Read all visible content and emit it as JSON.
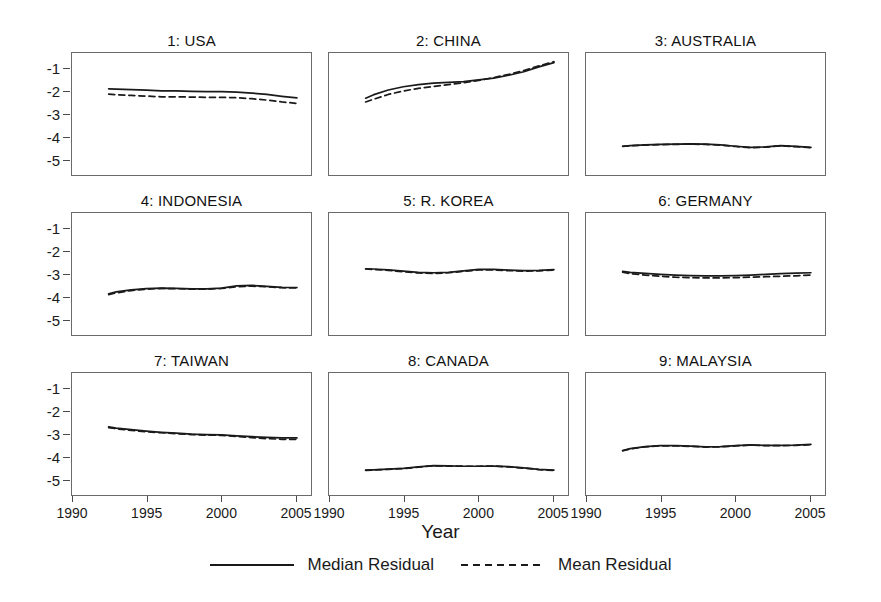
{
  "figure": {
    "xaxis_title": "Year",
    "yaxis_ticks": [
      "-1",
      "-2",
      "-3",
      "-4",
      "-5"
    ],
    "xaxis_ticks": [
      "1990",
      "1995",
      "2000",
      "2005"
    ]
  },
  "legend": {
    "position": "bottom-center",
    "entries": [
      {
        "label": "Median Residual",
        "style": "solid",
        "icon": "solid-line-icon"
      },
      {
        "label": "Mean Residual",
        "style": "dashed",
        "icon": "dashed-line-icon"
      }
    ]
  },
  "colors": {
    "line": "#1a1a1a",
    "frame": "#6b6b6b",
    "background": "#ffffff"
  },
  "chart_data": {
    "type": "line",
    "title": "",
    "xlabel": "Year",
    "ylabel": "",
    "xlim": [
      1990,
      2006
    ],
    "ylim": [
      -5.6,
      -0.35
    ],
    "yticks": [
      -1,
      -2,
      -3,
      -4,
      -5
    ],
    "xticks": [
      1990,
      1995,
      2000,
      2005
    ],
    "grid": false,
    "layout": "3x3 small multiples",
    "x": [
      1992.5,
      1993,
      1994,
      1995,
      1996,
      1997,
      1998,
      1999,
      2000,
      2001,
      2002,
      2003,
      2004,
      2005
    ],
    "panels": [
      {
        "index": 1,
        "name": "USA",
        "title": "1: USA",
        "series": [
          {
            "name": "Median Residual",
            "style": "solid",
            "values": [
              -1.88,
              -1.89,
              -1.91,
              -1.93,
              -1.97,
              -1.97,
              -1.99,
              -2.0,
              -2.0,
              -2.02,
              -2.06,
              -2.12,
              -2.2,
              -2.27
            ]
          },
          {
            "name": "Mean Residual",
            "style": "dashed",
            "values": [
              -2.11,
              -2.13,
              -2.16,
              -2.19,
              -2.22,
              -2.22,
              -2.23,
              -2.24,
              -2.24,
              -2.26,
              -2.3,
              -2.36,
              -2.44,
              -2.5
            ]
          }
        ]
      },
      {
        "index": 2,
        "name": "CHINA",
        "title": "2: CHINA",
        "series": [
          {
            "name": "Median Residual",
            "style": "solid",
            "values": [
              -2.28,
              -2.14,
              -1.93,
              -1.79,
              -1.7,
              -1.64,
              -1.6,
              -1.57,
              -1.5,
              -1.42,
              -1.3,
              -1.15,
              -0.94,
              -0.76
            ]
          },
          {
            "name": "Mean Residual",
            "style": "dashed",
            "values": [
              -2.44,
              -2.33,
              -2.12,
              -1.97,
              -1.86,
              -1.78,
              -1.7,
              -1.62,
              -1.52,
              -1.4,
              -1.26,
              -1.1,
              -0.9,
              -0.72
            ]
          }
        ]
      },
      {
        "index": 3,
        "name": "AUSTRALIA",
        "title": "3: AUSTRALIA",
        "series": [
          {
            "name": "Median Residual",
            "style": "solid",
            "values": [
              -4.33,
              -4.3,
              -4.27,
              -4.25,
              -4.24,
              -4.23,
              -4.24,
              -4.27,
              -4.33,
              -4.38,
              -4.36,
              -4.3,
              -4.34,
              -4.38
            ]
          },
          {
            "name": "Mean Residual",
            "style": "dashed",
            "values": [
              -4.34,
              -4.31,
              -4.28,
              -4.26,
              -4.25,
              -4.24,
              -4.25,
              -4.28,
              -4.34,
              -4.39,
              -4.37,
              -4.31,
              -4.35,
              -4.39
            ]
          }
        ]
      },
      {
        "index": 4,
        "name": "INDONESIA",
        "title": "4: INDONESIA",
        "series": [
          {
            "name": "Median Residual",
            "style": "solid",
            "values": [
              -3.8,
              -3.72,
              -3.63,
              -3.58,
              -3.56,
              -3.57,
              -3.59,
              -3.59,
              -3.56,
              -3.46,
              -3.44,
              -3.48,
              -3.52,
              -3.53
            ]
          },
          {
            "name": "Mean Residual",
            "style": "dashed",
            "values": [
              -3.83,
              -3.76,
              -3.66,
              -3.6,
              -3.57,
              -3.58,
              -3.6,
              -3.6,
              -3.57,
              -3.5,
              -3.47,
              -3.5,
              -3.54,
              -3.55
            ]
          }
        ]
      },
      {
        "index": 5,
        "name": "R. KOREA",
        "title": "5: R. KOREA",
        "series": [
          {
            "name": "Median Residual",
            "style": "solid",
            "values": [
              -2.73,
              -2.74,
              -2.78,
              -2.83,
              -2.88,
              -2.9,
              -2.88,
              -2.82,
              -2.76,
              -2.76,
              -2.79,
              -2.81,
              -2.8,
              -2.77
            ]
          },
          {
            "name": "Mean Residual",
            "style": "dashed",
            "values": [
              -2.74,
              -2.76,
              -2.8,
              -2.86,
              -2.91,
              -2.93,
              -2.9,
              -2.84,
              -2.78,
              -2.78,
              -2.81,
              -2.83,
              -2.82,
              -2.79
            ]
          }
        ]
      },
      {
        "index": 6,
        "name": "GERMANY",
        "title": "6: GERMANY",
        "series": [
          {
            "name": "Median Residual",
            "style": "solid",
            "values": [
              -2.84,
              -2.88,
              -2.93,
              -2.97,
              -3.0,
              -3.02,
              -3.03,
              -3.03,
              -3.02,
              -3.0,
              -2.97,
              -2.94,
              -2.92,
              -2.9
            ]
          },
          {
            "name": "Mean Residual",
            "style": "dashed",
            "values": [
              -2.88,
              -2.94,
              -3.0,
              -3.05,
              -3.09,
              -3.11,
              -3.12,
              -3.12,
              -3.11,
              -3.09,
              -3.07,
              -3.05,
              -3.03,
              -3.0
            ]
          }
        ]
      },
      {
        "index": 7,
        "name": "TAIWAN",
        "title": "7: TAIWAN",
        "series": [
          {
            "name": "Median Residual",
            "style": "solid",
            "values": [
              -2.65,
              -2.7,
              -2.77,
              -2.83,
              -2.88,
              -2.92,
              -2.96,
              -2.98,
              -2.99,
              -3.03,
              -3.07,
              -3.1,
              -3.12,
              -3.12
            ]
          },
          {
            "name": "Mean Residual",
            "style": "dashed",
            "values": [
              -2.68,
              -2.73,
              -2.8,
              -2.86,
              -2.9,
              -2.94,
              -2.98,
              -3.0,
              -3.01,
              -3.06,
              -3.11,
              -3.15,
              -3.18,
              -3.18
            ]
          }
        ]
      },
      {
        "index": 8,
        "name": "CANADA",
        "title": "8: CANADA",
        "series": [
          {
            "name": "Median Residual",
            "style": "solid",
            "values": [
              -4.5,
              -4.48,
              -4.45,
              -4.42,
              -4.36,
              -4.3,
              -4.31,
              -4.33,
              -4.33,
              -4.32,
              -4.35,
              -4.4,
              -4.46,
              -4.5
            ]
          },
          {
            "name": "Mean Residual",
            "style": "dashed",
            "values": [
              -4.51,
              -4.49,
              -4.46,
              -4.43,
              -4.37,
              -4.31,
              -4.32,
              -4.33,
              -4.33,
              -4.32,
              -4.36,
              -4.41,
              -4.47,
              -4.51
            ]
          }
        ]
      },
      {
        "index": 9,
        "name": "MALAYSIA",
        "title": "9: MALAYSIA",
        "series": [
          {
            "name": "Median Residual",
            "style": "solid",
            "values": [
              -3.66,
              -3.58,
              -3.49,
              -3.45,
              -3.45,
              -3.47,
              -3.5,
              -3.49,
              -3.45,
              -3.42,
              -3.44,
              -3.44,
              -3.43,
              -3.4
            ]
          },
          {
            "name": "Mean Residual",
            "style": "dashed",
            "values": [
              -3.67,
              -3.59,
              -3.5,
              -3.46,
              -3.46,
              -3.48,
              -3.51,
              -3.5,
              -3.46,
              -3.43,
              -3.45,
              -3.45,
              -3.44,
              -3.41
            ]
          }
        ]
      }
    ]
  }
}
